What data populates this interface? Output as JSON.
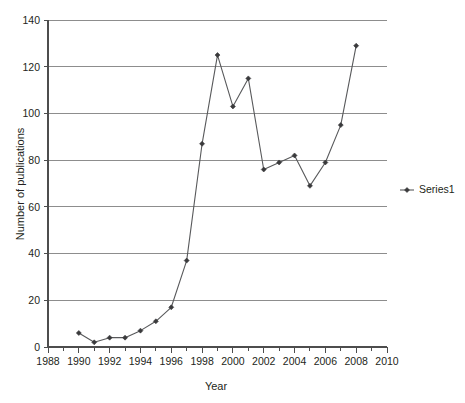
{
  "chart_data": {
    "type": "line",
    "title": "",
    "subtitle": "",
    "xlabel": "Year",
    "ylabel": "Number of publications",
    "xlim": [
      1988,
      2010
    ],
    "ylim": [
      0,
      140
    ],
    "xticks": [
      1988,
      1990,
      1992,
      1994,
      1996,
      1998,
      2000,
      2002,
      2004,
      2006,
      2008,
      2010
    ],
    "xtick_labels": [
      "1988",
      "1990",
      "1992",
      "1994",
      "1996",
      "1998",
      "2000",
      "2002",
      "2004",
      "2006",
      "2008",
      "2010"
    ],
    "yticks": [
      0,
      20,
      40,
      60,
      80,
      100,
      120,
      140
    ],
    "ytick_labels": [
      "0",
      "20",
      "40",
      "60",
      "80",
      "100",
      "120",
      "140"
    ],
    "x_minor_tick_step": 1,
    "grid": "horizontal",
    "legend_position": "right",
    "series": [
      {
        "name": "Series1",
        "marker": "diamond",
        "color": "#58595b",
        "x": [
          1990,
          1991,
          1992,
          1993,
          1994,
          1995,
          1996,
          1997,
          1998,
          1999,
          2000,
          2001,
          2002,
          2003,
          2004,
          2005,
          2006,
          2007,
          2008
        ],
        "values": [
          6,
          2,
          4,
          4,
          7,
          11,
          17,
          37,
          87,
          125,
          103,
          115,
          76,
          79,
          82,
          69,
          79,
          95,
          129
        ]
      }
    ]
  },
  "legend": {
    "entries": [
      {
        "label": "Series1"
      }
    ]
  },
  "axes": {
    "x_title": "Year",
    "y_title": "Number of publications"
  },
  "colors": {
    "series": "#58595b",
    "grid": "#8d8d8d",
    "axis": "#4d4d4d",
    "text": "#231f20",
    "background": "#ffffff"
  }
}
